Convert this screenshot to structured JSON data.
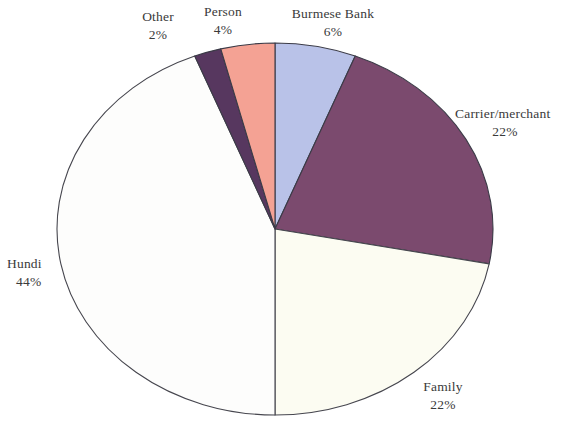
{
  "chart_data": {
    "type": "pie",
    "title": "",
    "subtitle": "",
    "xlabel": "",
    "ylabel": "",
    "legend_position": "none",
    "grid": false,
    "labels_show_percent": true,
    "start_angle_deg": 0,
    "direction": "clockwise",
    "categories": [
      "Burmese Bank",
      "Carrier/merchant",
      "Family",
      "Hundi",
      "Other",
      "Person"
    ],
    "values": [
      6,
      22,
      22,
      44,
      2,
      4
    ],
    "slices": [
      {
        "name": "Burmese Bank",
        "label": "Burmese Bank",
        "percent": 6,
        "percent_label": "6%",
        "color": "#b9c2e8",
        "outline": "#3b3b47",
        "start_deg": 0,
        "end_deg": 21.6
      },
      {
        "name": "Carrier/merchant",
        "label": "Carrier/merchant",
        "percent": 22,
        "percent_label": "22%",
        "color": "#7b4a6e",
        "outline": "#3b3b47",
        "start_deg": 21.6,
        "end_deg": 100.8
      },
      {
        "name": "Family",
        "label": "Family",
        "percent": 22,
        "percent_label": "22%",
        "color": "#fcfcf2",
        "outline": "#46464e",
        "start_deg": 100.8,
        "end_deg": 180
      },
      {
        "name": "Hundi",
        "label": "Hundi",
        "percent": 44,
        "percent_label": "44%",
        "color": "#fdfdfc",
        "outline": "#46464e",
        "start_deg": 180,
        "end_deg": 338.4
      },
      {
        "name": "Other",
        "label": "Other",
        "percent": 2,
        "percent_label": "2%",
        "color": "#57375f",
        "outline": "#3b3b47",
        "start_deg": 338.4,
        "end_deg": 345.6
      },
      {
        "name": "Person",
        "label": "Person",
        "percent": 4,
        "percent_label": "4%",
        "color": "#f4a294",
        "outline": "#3b3b47",
        "start_deg": 345.6,
        "end_deg": 360
      }
    ]
  },
  "labels": {
    "other": {
      "name": "Other",
      "percent": "2%"
    },
    "person": {
      "name": "Person",
      "percent": "4%"
    },
    "bank": {
      "name": "Burmese Bank",
      "percent": "6%"
    },
    "carrier": {
      "name": "Carrier/merchant",
      "percent": "22%"
    },
    "family": {
      "name": "Family",
      "percent": "22%"
    },
    "hundi": {
      "name": "Hundi",
      "percent": "44%"
    }
  },
  "colors": {
    "background": "#ffffff",
    "text": "#3a3a3a",
    "outline": "#3b3b47",
    "burmese_bank": "#b9c2e8",
    "carrier_merchant": "#7b4a6e",
    "family": "#fcfcf2",
    "hundi": "#fdfdfc",
    "other": "#57375f",
    "person": "#f4a294"
  }
}
